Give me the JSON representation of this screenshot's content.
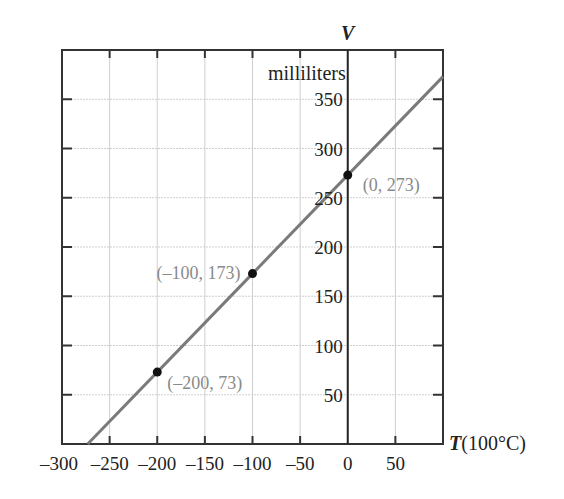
{
  "chart_data": {
    "type": "line",
    "title": "",
    "xlabel": "T(100°C)",
    "xlabel_var": "T",
    "xlabel_unit": "(100°C)",
    "ylabel": "V",
    "ylabel_unit": "milliliters",
    "xlim": [
      -300,
      100
    ],
    "ylim": [
      0,
      400
    ],
    "grid": true,
    "x_ticks": [
      -300,
      -250,
      -200,
      -150,
      -100,
      -50,
      0,
      50
    ],
    "x_tick_labels": [
      "–300",
      "–250",
      "–200",
      "–150",
      "–100",
      "–50",
      "0",
      "50"
    ],
    "y_ticks": [
      50,
      100,
      150,
      200,
      250,
      300,
      350
    ],
    "y_tick_labels": [
      "50",
      "100",
      "150",
      "200",
      "250",
      "300",
      "350"
    ],
    "series": [
      {
        "name": "V = T + 273",
        "line": {
          "x": [
            -273,
            100
          ],
          "y": [
            0,
            373
          ]
        },
        "color": "#7a7a7a"
      }
    ],
    "points": [
      {
        "x": -200,
        "y": 73,
        "label": "(–200, 73)",
        "label_pos": "below-right"
      },
      {
        "x": -100,
        "y": 173,
        "label": "(–100, 173)",
        "label_pos": "left"
      },
      {
        "x": 0,
        "y": 273,
        "label": "(0, 273)",
        "label_pos": "right"
      }
    ],
    "colors": {
      "line": "#7a7a7a",
      "grid": "#cfcfcf",
      "frame": "#333333",
      "point": "#111111",
      "point_label": "#8a8a8a"
    }
  }
}
